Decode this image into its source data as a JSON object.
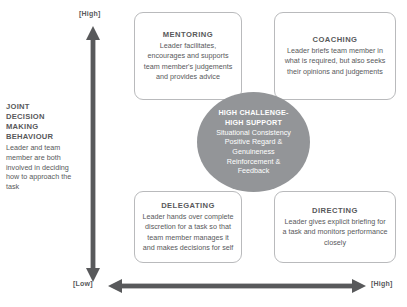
{
  "axes": {
    "vertical": {
      "high_label": "[High]",
      "icon": "double-headed-up-down-arrow-icon"
    },
    "horizontal": {
      "low_label": "[Low]",
      "high_label": "[High]",
      "icon": "double-headed-left-right-arrow-icon"
    }
  },
  "left_label": {
    "heading_lines": "JOINT\nDECISION\nMAKING\nBEHAVIOUR",
    "body": "Leader and team member are both involved in deciding how to approach the task"
  },
  "quadrants": [
    {
      "id": "mentoring",
      "title": "MENTORING",
      "desc": "Leader facilitates, encourages and supports team member's judgements and provides advice"
    },
    {
      "id": "coaching",
      "title": "COACHING",
      "desc": "Leader briefs team member in what is required, but also seeks their opinions and judgements"
    },
    {
      "id": "delegating",
      "title": "DELEGATING",
      "desc": "Leader hands over complete discretion for a task so that team member manages it and makes decisions for self"
    },
    {
      "id": "directing",
      "title": "DIRECTING",
      "desc": "Leader gives explicit briefing for a task and monitors performance closely"
    }
  ],
  "centre": {
    "title": "HIGH CHALLENGE-\nHIGH SUPPORT",
    "body": "Situational Consistency\nPositive Regard &\nGenuineness\nReinforcement &\nFeedback"
  },
  "colors": {
    "text": "#58595b",
    "box_border": "#b9babc",
    "circle_fill": "#939598",
    "arrow": "#58595b",
    "background": "#ffffff"
  }
}
